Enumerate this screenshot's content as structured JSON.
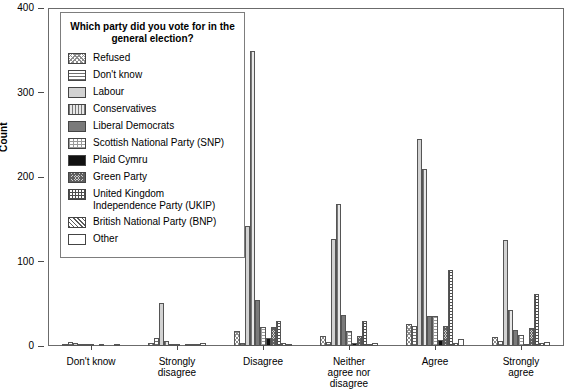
{
  "chart_data": {
    "type": "bar",
    "title": "",
    "xlabel": "",
    "ylabel": "Count",
    "ylim": [
      0,
      400
    ],
    "yticks": [
      0,
      100,
      200,
      300,
      400
    ],
    "grid": false,
    "legend_position": "inside-upper-left",
    "legend_title": "Which party did you vote\nfor in the general election?",
    "categories": [
      "Don't know",
      "Strongly\ndisagree",
      "Disagree",
      "Neither\nagree nor\ndisagree",
      "Agree",
      "Strongly\nagree"
    ],
    "series": [
      {
        "name": "Refused",
        "pattern": "checkered",
        "values": [
          1,
          3,
          18,
          12,
          26,
          11
        ]
      },
      {
        "name": "Don't know",
        "pattern": "horizontal-lines",
        "values": [
          5,
          9,
          4,
          5,
          24,
          6
        ]
      },
      {
        "name": "Labour",
        "pattern": "light-gray",
        "values": [
          4,
          51,
          142,
          127,
          245,
          125
        ]
      },
      {
        "name": "Conservatives",
        "pattern": "vertical-lines",
        "values": [
          2,
          6,
          349,
          168,
          209,
          43
        ]
      },
      {
        "name": "Liberal Democrats",
        "pattern": "dark-gray",
        "values": [
          2,
          2,
          54,
          37,
          35,
          19
        ]
      },
      {
        "name": "Scottish National Party (SNP)",
        "pattern": "sparse-dots",
        "values": [
          1,
          1,
          22,
          18,
          36,
          13
        ]
      },
      {
        "name": "Plaid Cymru",
        "pattern": "black",
        "values": [
          0,
          0,
          10,
          3,
          7,
          1
        ]
      },
      {
        "name": "Green Party",
        "pattern": "dense-dots",
        "values": [
          1,
          1,
          23,
          12,
          24,
          21
        ]
      },
      {
        "name": "United Kingdom\nIndependence Party (UKIP)",
        "pattern": "grid",
        "values": [
          0,
          1,
          30,
          30,
          90,
          62
        ]
      },
      {
        "name": "British National Party (BNP)",
        "pattern": "diagonal-hatch",
        "values": [
          0,
          2,
          3,
          2,
          3,
          3
        ]
      },
      {
        "name": "Other",
        "pattern": "white",
        "values": [
          1,
          3,
          2,
          3,
          8,
          5
        ]
      }
    ]
  },
  "axis": {
    "y_label": "Count",
    "y_ticks": [
      "0",
      "100",
      "200",
      "300",
      "400"
    ]
  }
}
